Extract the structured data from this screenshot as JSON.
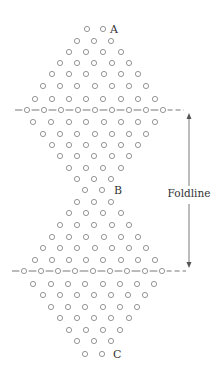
{
  "diagram": {
    "type": "folded-lattice-of-holes",
    "colors": {
      "circle_stroke": "#8a8a8a",
      "line": "#555555",
      "text": "#333333",
      "background": "#ffffff"
    },
    "point_labels": [
      {
        "id": "A",
        "text": "A",
        "x": 113,
        "y": 33
      },
      {
        "id": "B",
        "text": "B",
        "x": 117,
        "y": 194
      },
      {
        "id": "C",
        "text": "C",
        "x": 116,
        "y": 358
      }
    ],
    "foldline_label": {
      "text": "Foldline",
      "x": 189,
      "y": 197
    },
    "fold_lines": [
      {
        "id": "top",
        "y": 110,
        "x1": 15,
        "x2": 184,
        "circle_x": [
          27,
          44,
          61,
          78,
          95,
          112,
          129,
          146,
          163
        ]
      },
      {
        "id": "bottom",
        "y": 271,
        "x1": 12,
        "x2": 186,
        "circle_x": [
          24,
          41,
          58,
          75,
          93,
          110,
          127,
          145,
          162
        ]
      }
    ],
    "arrow": {
      "x": 189,
      "y_top": 113,
      "y_bottom": 268,
      "gap_top": 186,
      "gap_bottom": 204
    },
    "circle_rows": [
      {
        "y": 29,
        "x": [
          87,
          103
        ]
      },
      {
        "y": 41,
        "x": [
          77,
          94,
          111
        ]
      },
      {
        "y": 52,
        "x": [
          69,
          86,
          103,
          121
        ]
      },
      {
        "y": 63,
        "x": [
          60,
          77,
          94,
          112,
          129
        ]
      },
      {
        "y": 74,
        "x": [
          52,
          69,
          86,
          104,
          121,
          138
        ]
      },
      {
        "y": 86,
        "x": [
          43,
          60,
          77,
          95,
          112,
          129,
          146
        ]
      },
      {
        "y": 99,
        "x": [
          35,
          52,
          69,
          86,
          103,
          121,
          138,
          155
        ]
      },
      {
        "y": 122,
        "x": [
          33,
          51,
          69,
          86,
          104,
          121,
          138,
          155
        ]
      },
      {
        "y": 134,
        "x": [
          43,
          60,
          77,
          95,
          112,
          129,
          146
        ]
      },
      {
        "y": 145,
        "x": [
          52,
          69,
          86,
          104,
          121,
          138
        ]
      },
      {
        "y": 156,
        "x": [
          60,
          77,
          94,
          112,
          129
        ]
      },
      {
        "y": 168,
        "x": [
          69,
          86,
          103,
          121
        ]
      },
      {
        "y": 179,
        "x": [
          77,
          94,
          111
        ]
      },
      {
        "y": 190,
        "x": [
          85,
          102
        ]
      },
      {
        "y": 202,
        "x": [
          77,
          94,
          111
        ]
      },
      {
        "y": 213,
        "x": [
          69,
          86,
          103,
          121
        ]
      },
      {
        "y": 225,
        "x": [
          60,
          77,
          94,
          112,
          129
        ]
      },
      {
        "y": 237,
        "x": [
          52,
          69,
          86,
          104,
          121,
          138
        ]
      },
      {
        "y": 248,
        "x": [
          43,
          60,
          77,
          95,
          112,
          129,
          146
        ]
      },
      {
        "y": 260,
        "x": [
          35,
          52,
          69,
          86,
          103,
          121,
          138,
          155
        ]
      },
      {
        "y": 284,
        "x": [
          33,
          51,
          68,
          85,
          103,
          120,
          137,
          154
        ]
      },
      {
        "y": 295,
        "x": [
          43,
          60,
          77,
          94,
          111,
          128,
          145
        ]
      },
      {
        "y": 307,
        "x": [
          51,
          68,
          85,
          103,
          120,
          137
        ]
      },
      {
        "y": 318,
        "x": [
          60,
          77,
          94,
          111,
          129
        ]
      },
      {
        "y": 330,
        "x": [
          69,
          86,
          103,
          120
        ]
      },
      {
        "y": 341,
        "x": [
          77,
          94,
          111
        ]
      },
      {
        "y": 354,
        "x": [
          85,
          102
        ]
      }
    ],
    "circle_radius": 2.6
  }
}
